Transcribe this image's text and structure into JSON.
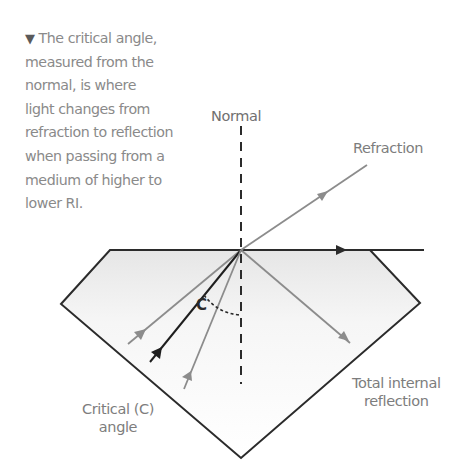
{
  "caption": {
    "marker_icon": "down-triangle-icon",
    "marker_glyph": "▼",
    "lines": [
      "The critical angle,",
      "measured from the",
      "normal, is where",
      "light changes from",
      "refraction to reflection",
      "when passing from a",
      "medium of higher to",
      "lower RI."
    ]
  },
  "diagram": {
    "labels": {
      "normal": "Normal",
      "refraction": "Refraction",
      "critical_angle_line1": "Critical (C)",
      "critical_angle_line2": "angle",
      "tir_line1": "Total internal",
      "tir_line2": "reflection",
      "angle_symbol": "C"
    },
    "colors": {
      "outline": "#2b2b2b",
      "gray_ray": "#8c8c8c",
      "black_ray": "#1e1e1e",
      "fill_top": "#e9e9e9",
      "fill_bottom": "#ffffff",
      "label_text": "#7d7d7d"
    }
  }
}
